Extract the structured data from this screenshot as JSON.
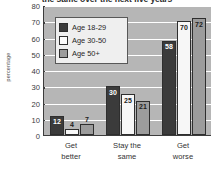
{
  "chart_data": {
    "type": "bar",
    "title": "the same over the next five years",
    "xlabel": "",
    "ylabel": "percentage",
    "ylim": [
      0,
      80
    ],
    "yticks": [
      80,
      70,
      60,
      50,
      40,
      30,
      20,
      10,
      0
    ],
    "grid": true,
    "legend_position": "upper-left-inside",
    "categories": [
      "Get better",
      "Stay the same",
      "Get worse"
    ],
    "category_lines": [
      [
        "Get",
        "better"
      ],
      [
        "Stay the",
        "same"
      ],
      [
        "Get",
        "worse"
      ]
    ],
    "series": [
      {
        "name": "Age 18-29",
        "color": "#3b3b3b",
        "values": [
          12,
          30,
          58
        ]
      },
      {
        "name": "Age 30-50",
        "color": "#f7f7f7",
        "values": [
          4,
          25,
          70
        ]
      },
      {
        "name": "Age 50+",
        "color": "#9c9c9c",
        "values": [
          7,
          21,
          72
        ]
      }
    ]
  },
  "legend": {
    "items": [
      {
        "label": "Age 18-29",
        "swatch": "c-dark"
      },
      {
        "label": "Age 30-50",
        "swatch": "c-white"
      },
      {
        "label": "Age 50+",
        "swatch": "c-gray"
      }
    ]
  },
  "axis": {
    "y_title": "percentage",
    "y_tick_labels": [
      "80",
      "70",
      "60",
      "50",
      "40",
      "30",
      "20",
      "10",
      "0"
    ]
  },
  "bar_value_labels": {
    "group1": [
      "12",
      "4",
      "7"
    ],
    "group2": [
      "30",
      "25",
      "21"
    ],
    "group3": [
      "58",
      "70",
      "72"
    ]
  }
}
